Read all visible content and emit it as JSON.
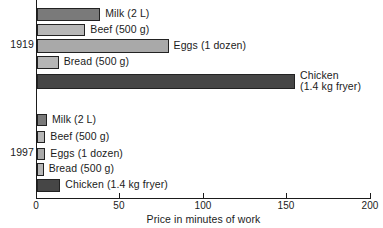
{
  "chart_data": {
    "type": "bar",
    "orientation": "horizontal",
    "title": "",
    "xlabel": "Price in minutes of work",
    "ylabel": "",
    "xlim": [
      0,
      200
    ],
    "xticks": [
      0,
      50,
      100,
      150,
      200
    ],
    "xtick_labels": [
      "0",
      "50",
      "100",
      "150",
      "200"
    ],
    "grid": false,
    "legend": "none",
    "groups": [
      {
        "name": "1919",
        "bars": [
          {
            "label": "Milk (2 L)",
            "value": 38,
            "color": "#7a7a7a"
          },
          {
            "label": "Beef (500 g)",
            "value": 29,
            "color": "#b6b6b6"
          },
          {
            "label": "Eggs (1 dozen)",
            "value": 79,
            "color": "#a9a9a9"
          },
          {
            "label": "Bread (500 g)",
            "value": 13,
            "color": "#b6b6b6"
          },
          {
            "label": "Chicken\n(1.4 kg fryer)",
            "value": 155,
            "color": "#464646"
          }
        ]
      },
      {
        "name": "1997",
        "bars": [
          {
            "label": "Milk (2 L)",
            "value": 6,
            "color": "#7a7a7a"
          },
          {
            "label": "Beef (500 g)",
            "value": 5,
            "color": "#b6b6b6"
          },
          {
            "label": "Eggs (1 dozen)",
            "value": 5,
            "color": "#a9a9a9"
          },
          {
            "label": "Bread (500 g)",
            "value": 4,
            "color": "#b6b6b6"
          },
          {
            "label": "Chicken (1.4 kg fryer)",
            "value": 14,
            "color": "#464646"
          }
        ]
      }
    ]
  },
  "axis": {
    "x_title": "Price in minutes of work",
    "tick_0": "0",
    "tick_50": "50",
    "tick_100": "100",
    "tick_150": "150",
    "tick_200": "200"
  },
  "groups": {
    "g1919": "1919",
    "g1997": "1997"
  }
}
